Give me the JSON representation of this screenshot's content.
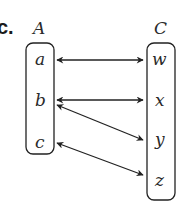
{
  "part_label": "c.",
  "sets": {
    "domain": {
      "name": "A",
      "elements": [
        "a",
        "b",
        "c"
      ]
    },
    "codomain": {
      "name": "C",
      "elements": [
        "w",
        "x",
        "y",
        "z"
      ]
    }
  },
  "mappings": [
    {
      "from": "a",
      "to": "w",
      "arrow": "double-headed"
    },
    {
      "from": "b",
      "to": "x",
      "arrow": "double-headed"
    },
    {
      "from": "b",
      "to": "y",
      "arrow": "double-headed"
    },
    {
      "from": "c",
      "to": "z",
      "arrow": "double-headed"
    }
  ],
  "colors": {
    "stroke": "#222222",
    "text": "#2a2a2a",
    "background": "#ffffff"
  }
}
